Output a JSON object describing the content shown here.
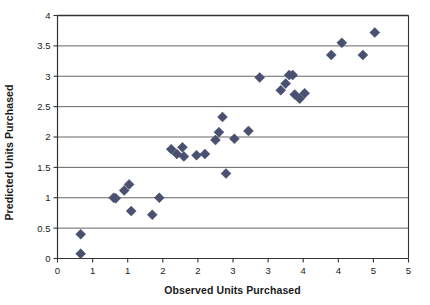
{
  "chart_data": {
    "type": "scatter",
    "title": "",
    "xlabel": "Observed Units Purchased",
    "ylabel": "Predicted Units Purchased",
    "xlim": [
      0,
      5
    ],
    "ylim": [
      0,
      4
    ],
    "x_tick_values": [
      0,
      0.5,
      1,
      1.5,
      2,
      2.5,
      3,
      3.5,
      4,
      4.5,
      5
    ],
    "x_tick_labels": [
      "0",
      "1",
      "1",
      "2",
      "2",
      "3",
      "3",
      "4",
      "4",
      "5"
    ],
    "x_tick_label_values": [
      0,
      0.5,
      1,
      1.5,
      2,
      2.5,
      3,
      3.5,
      4,
      4.5
    ],
    "y_tick_values": [
      0,
      0.5,
      1,
      1.5,
      2,
      2.5,
      3,
      3.5,
      4
    ],
    "y_tick_labels": [
      "0",
      "0.5",
      "1",
      "1.5",
      "2",
      "2.5",
      "3",
      "3.5",
      "4"
    ],
    "grid": "horizontal",
    "legend": "none",
    "marker": {
      "shape": "diamond",
      "color": "#4a5070",
      "size": 5
    },
    "series": [
      {
        "name": "Predicted vs Observed",
        "points": [
          [
            0.33,
            0.4
          ],
          [
            0.33,
            0.08
          ],
          [
            0.8,
            1.0
          ],
          [
            0.83,
            0.99
          ],
          [
            0.95,
            1.12
          ],
          [
            1.02,
            1.22
          ],
          [
            1.05,
            0.78
          ],
          [
            1.35,
            0.72
          ],
          [
            1.45,
            1.0
          ],
          [
            1.62,
            1.8
          ],
          [
            1.7,
            1.72
          ],
          [
            1.78,
            1.83
          ],
          [
            1.8,
            1.68
          ],
          [
            1.98,
            1.7
          ],
          [
            2.1,
            1.72
          ],
          [
            2.25,
            1.95
          ],
          [
            2.3,
            2.08
          ],
          [
            2.35,
            2.33
          ],
          [
            2.4,
            1.4
          ],
          [
            2.52,
            1.97
          ],
          [
            2.72,
            2.1
          ],
          [
            2.88,
            2.98
          ],
          [
            3.18,
            2.77
          ],
          [
            3.25,
            2.88
          ],
          [
            3.3,
            3.02
          ],
          [
            3.35,
            3.02
          ],
          [
            3.38,
            2.7
          ],
          [
            3.45,
            2.63
          ],
          [
            3.52,
            2.72
          ],
          [
            3.9,
            3.35
          ],
          [
            4.05,
            3.55
          ],
          [
            4.35,
            3.35
          ],
          [
            4.52,
            3.72
          ]
        ]
      }
    ]
  },
  "axes": {
    "x_title": "Observed Units Purchased",
    "y_title": "Predicted Units Purchased"
  },
  "colors": {
    "marker": "#4a5070",
    "axis": "#333333",
    "grid": "#555555",
    "background": "#ffffff"
  }
}
